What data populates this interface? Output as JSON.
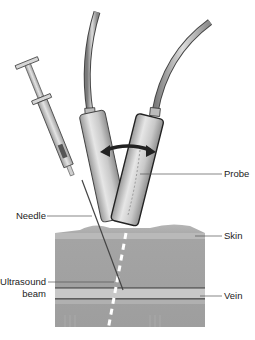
{
  "diagram": {
    "labels": {
      "probe": "Probe",
      "skin": "Skin",
      "vein": "Vein",
      "needle": "Needle",
      "ultrasound_beam_line1": "Ultrasound",
      "ultrasound_beam_line2": "beam"
    },
    "colors": {
      "tissue": "#a3a3a3",
      "tissue_light": "#b8b8b8",
      "vein_band": "#c9c9c9",
      "probe_body": "#c4c4c4",
      "outline": "#333333",
      "arrow": "#222222",
      "beam_dash": "#ffffff",
      "leader_line": "#555555"
    },
    "icons": [
      "syringe-icon",
      "probe-icon",
      "double-arrow-icon",
      "needle-icon",
      "ultrasound-beam-icon"
    ]
  }
}
